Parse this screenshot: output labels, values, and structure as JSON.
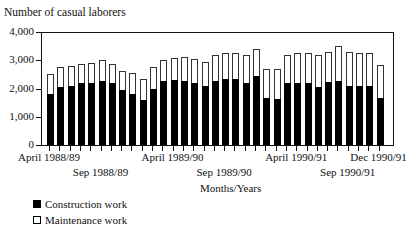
{
  "chart_data": {
    "type": "bar",
    "stacked": true,
    "title": "",
    "ylabel": "Number of casual laborers",
    "xlabel": "Months/Years",
    "ylim": [
      0,
      4000
    ],
    "yticks": [
      "0",
      "1,000",
      "2,000",
      "3,000",
      "4,000"
    ],
    "grid": false,
    "legend_position": "bottom-left",
    "x_tick_labels": [
      {
        "label": "April 1988/89",
        "index": 0,
        "row": 0
      },
      {
        "label": "Sep 1988/89",
        "index": 5,
        "row": 1
      },
      {
        "label": "April 1989/90",
        "index": 12,
        "row": 0
      },
      {
        "label": "Sep 1989/90",
        "index": 17,
        "row": 1
      },
      {
        "label": "April 1990/91",
        "index": 24,
        "row": 0
      },
      {
        "label": "Sep 1990/91",
        "index": 29,
        "row": 1
      },
      {
        "label": "Dec 1990/91",
        "index": 32,
        "row": 0
      }
    ],
    "categories": [
      "Apr 1988",
      "May 1988",
      "Jun 1988",
      "Jul 1988",
      "Aug 1988",
      "Sep 1988",
      "Oct 1988",
      "Nov 1988",
      "Dec 1988",
      "Jan 1989",
      "Feb 1989",
      "Mar 1989",
      "Apr 1989",
      "May 1989",
      "Jun 1989",
      "Jul 1989",
      "Aug 1989",
      "Sep 1989",
      "Oct 1989",
      "Nov 1989",
      "Dec 1989",
      "Jan 1990",
      "Feb 1990",
      "Mar 1990",
      "Apr 1990",
      "May 1990",
      "Jun 1990",
      "Jul 1990",
      "Aug 1990",
      "Sep 1990",
      "Oct 1990",
      "Nov 1990",
      "Dec 1990"
    ],
    "series": [
      {
        "name": "Construction work",
        "color": "#000000",
        "values": [
          1800,
          2050,
          2100,
          2200,
          2180,
          2280,
          2180,
          1950,
          1800,
          1600,
          2000,
          2250,
          2300,
          2250,
          2200,
          2100,
          2250,
          2320,
          2320,
          2200,
          2450,
          1650,
          1620,
          2200,
          2200,
          2200,
          2050,
          2230,
          2250,
          2100,
          2100,
          2100,
          1650
        ]
      },
      {
        "name": "Maintenance work",
        "color": "#ffffff",
        "values": [
          700,
          700,
          700,
          680,
          740,
          720,
          700,
          670,
          750,
          750,
          750,
          750,
          780,
          850,
          850,
          850,
          950,
          930,
          930,
          1000,
          950,
          1050,
          1060,
          1000,
          1050,
          1050,
          1150,
          1070,
          1250,
          1200,
          1150,
          1150,
          1200
        ]
      }
    ],
    "totals": [
      2500,
      2750,
      2800,
      2880,
      2920,
      3000,
      2880,
      2620,
      2550,
      2350,
      2750,
      3000,
      3080,
      3100,
      3050,
      2950,
      3200,
      3250,
      3250,
      3200,
      3400,
      2700,
      2680,
      3200,
      3250,
      3250,
      3200,
      3300,
      3500,
      3300,
      3250,
      3250,
      2850
    ]
  },
  "legend": {
    "items": [
      {
        "label": "Construction work",
        "color": "#000000"
      },
      {
        "label": "Maintenance work",
        "color": "#ffffff"
      }
    ]
  }
}
